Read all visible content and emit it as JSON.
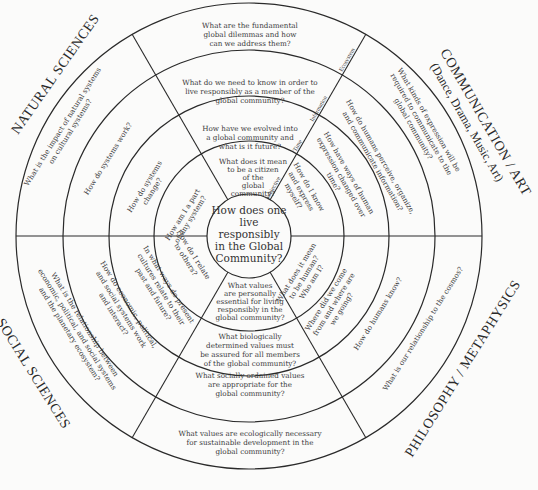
{
  "diagram": {
    "center_question": [
      "How does one",
      "live",
      "responsibly",
      "in the Global",
      "Community?"
    ],
    "sectors": {
      "natural_sciences": "NATURAL SCIENCES",
      "communication_art": "COMMUNICATION / ART",
      "communication_art_sub": "(Dance, Drama, Music, Art)",
      "philosophy": "PHILOSOPHY / METAPHYSICS",
      "social_sciences": "SOCIAL SCIENCES"
    },
    "axis_labels": {
      "subjective": "Subjective",
      "time": "Time",
      "information": "Information",
      "ecosystem": "Ecosystem"
    },
    "top_column": [
      [
        "What are the fundamental",
        "global dilemmas and how",
        "can we address them?"
      ],
      [
        "What do we need to know in order to",
        "live responsibly as a member of the",
        "global community?"
      ],
      [
        "How have we evolved into",
        "a global community and",
        "what is it future?"
      ],
      [
        "What does it mean",
        "to be a citizen",
        "of the",
        "global",
        "community?"
      ]
    ],
    "bottom_column": [
      [
        "What values",
        "are personally",
        "essential for living",
        "responsibly in the",
        "global community?"
      ],
      [
        "What biologically",
        "determined values must",
        "be assured for all members",
        "of the global community?"
      ],
      [
        "What socially ordained values",
        "are appropriate for the",
        "global community?"
      ],
      [
        "What values are ecologically necessary",
        "for sustainable development in the",
        "global community?"
      ]
    ],
    "upper_left": [
      [
        "How am I a part",
        "of any system?"
      ],
      [
        "How do systems",
        "change?"
      ],
      [
        "How do systems work?"
      ],
      [
        "What is the impact of natural systems",
        "on cultural systems?"
      ]
    ],
    "upper_right": [
      [
        "How do I know",
        "and express",
        "myself?"
      ],
      [
        "How have ways of human",
        "expression changed over",
        "time?"
      ],
      [
        "How do humans perceive, organize,",
        "and communicate information?"
      ],
      [
        "What kinds of expression will be",
        "required to communicate to the",
        "global community?"
      ]
    ],
    "lower_left": [
      [
        "How do I relate",
        "to others?"
      ],
      [
        "In what ways do present",
        "cultures relate to their",
        "past and future?"
      ],
      [
        "How do economic, political,",
        "and social systems work",
        "and interact?"
      ],
      [
        "What is the relationship between",
        "economic, political, and social systems",
        "and the planetary ecosystem?"
      ]
    ],
    "lower_right": [
      [
        "What does it mean",
        "to be human?",
        "Who am I?"
      ],
      [
        "Where did we come",
        "from and where are",
        "we going?"
      ],
      [
        "How do humans know?"
      ],
      [
        "What is our relationship to the cosmos?"
      ]
    ]
  }
}
